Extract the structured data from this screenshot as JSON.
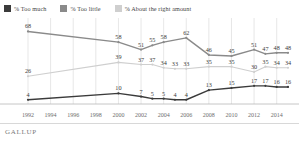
{
  "legend": {
    "items": [
      {
        "label": "% Too much",
        "color": "#3b3b3b",
        "key": "too_much"
      },
      {
        "label": "% Too little",
        "color": "#8a8a8a",
        "key": "too_little"
      },
      {
        "label": "% About the right amount",
        "color": "#cfcfcf",
        "key": "about_right"
      }
    ]
  },
  "footer": {
    "brand": "GALLUP"
  },
  "chart_data": {
    "type": "line",
    "title": "",
    "subtitle": "",
    "xlabel": "",
    "ylabel": "",
    "ylim": [
      0,
      75
    ],
    "grid": true,
    "legend_position": "top-left",
    "x": [
      1992,
      1994,
      1996,
      1998,
      2000,
      2001,
      2002,
      2003,
      2004,
      2005,
      2006,
      2008,
      2010,
      2012,
      2013,
      2014,
      2015
    ],
    "tick_labels": [
      "1992",
      "1994",
      "1996",
      "1998",
      "2000",
      "2002",
      "2004",
      "2006",
      "2008",
      "2010",
      "2012",
      "2014"
    ],
    "tick_values": [
      1992,
      1994,
      1996,
      1998,
      2000,
      2002,
      2004,
      2006,
      2008,
      2010,
      2012,
      2014
    ],
    "series": [
      {
        "name": "% Too little",
        "color": "#8a8a8a",
        "points": [
          {
            "x": 1992,
            "y": 68,
            "label": "68"
          },
          {
            "x": 2000,
            "y": 58,
            "label": "58"
          },
          {
            "x": 2002,
            "y": 51,
            "label": "51"
          },
          {
            "x": 2003,
            "y": 55,
            "label": "55"
          },
          {
            "x": 2004,
            "y": 58,
            "label": "58"
          },
          {
            "x": 2006,
            "y": 62,
            "label": "62"
          },
          {
            "x": 2008,
            "y": 46,
            "label": "46"
          },
          {
            "x": 2010,
            "y": 45,
            "label": "45"
          },
          {
            "x": 2012,
            "y": 51,
            "label": "51"
          },
          {
            "x": 2013,
            "y": 47,
            "label": "47"
          },
          {
            "x": 2014,
            "y": 48,
            "label": "48"
          },
          {
            "x": 2015,
            "y": 48,
            "label": "48"
          }
        ]
      },
      {
        "name": "% About the right amount",
        "color": "#cfcfcf",
        "points": [
          {
            "x": 1992,
            "y": 26,
            "label": "26"
          },
          {
            "x": 2000,
            "y": 39,
            "label": "39"
          },
          {
            "x": 2002,
            "y": 37,
            "label": "37"
          },
          {
            "x": 2003,
            "y": 37,
            "label": "37"
          },
          {
            "x": 2004,
            "y": 34,
            "label": "34"
          },
          {
            "x": 2005,
            "y": 33,
            "label": "33"
          },
          {
            "x": 2006,
            "y": 33,
            "label": "33"
          },
          {
            "x": 2008,
            "y": 35,
            "label": "35"
          },
          {
            "x": 2010,
            "y": 35,
            "label": "35"
          },
          {
            "x": 2012,
            "y": 30,
            "label": "30"
          },
          {
            "x": 2013,
            "y": 35,
            "label": "35"
          },
          {
            "x": 2014,
            "y": 34,
            "label": "34"
          },
          {
            "x": 2015,
            "y": 34,
            "label": "34"
          }
        ]
      },
      {
        "name": "% Too much",
        "color": "#3b3b3b",
        "points": [
          {
            "x": 1992,
            "y": 4,
            "label": "4"
          },
          {
            "x": 2000,
            "y": 10,
            "label": "10"
          },
          {
            "x": 2002,
            "y": 7,
            "label": "7"
          },
          {
            "x": 2003,
            "y": 5,
            "label": "5"
          },
          {
            "x": 2004,
            "y": 5,
            "label": "5"
          },
          {
            "x": 2005,
            "y": 4,
            "label": "4"
          },
          {
            "x": 2006,
            "y": 4,
            "label": "4"
          },
          {
            "x": 2008,
            "y": 13,
            "label": "13"
          },
          {
            "x": 2010,
            "y": 15,
            "label": "15"
          },
          {
            "x": 2012,
            "y": 17,
            "label": "17"
          },
          {
            "x": 2013,
            "y": 17,
            "label": "17"
          },
          {
            "x": 2014,
            "y": 16,
            "label": "16"
          },
          {
            "x": 2015,
            "y": 16,
            "label": "16"
          }
        ]
      }
    ]
  }
}
